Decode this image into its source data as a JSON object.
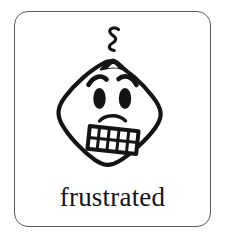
{
  "card": {
    "type": "emotion-flashcard",
    "caption": "frustrated",
    "border_color": "#5b5b5b",
    "background_color": "#ffffff",
    "ink_color": "#141414"
  },
  "illustration": {
    "name": "frustrated-face",
    "style": "hand-drawn black ink line art",
    "head_shape": "rounded diamond",
    "parts": [
      {
        "name": "steam-squiggle",
        "label": "steam squiggle"
      },
      {
        "name": "hair-tuft",
        "label": "hair tuft"
      },
      {
        "name": "eyebrow-left",
        "label": "angled left eyebrow"
      },
      {
        "name": "eyebrow-right",
        "label": "angled right eyebrow"
      },
      {
        "name": "eye-left",
        "label": "left eye"
      },
      {
        "name": "eye-right",
        "label": "right eye"
      },
      {
        "name": "frown-curve",
        "label": "frown curve"
      },
      {
        "name": "gritted-teeth-mouth",
        "label": "gritted teeth mouth"
      }
    ],
    "teeth_rows": 2,
    "teeth_columns": 5
  }
}
